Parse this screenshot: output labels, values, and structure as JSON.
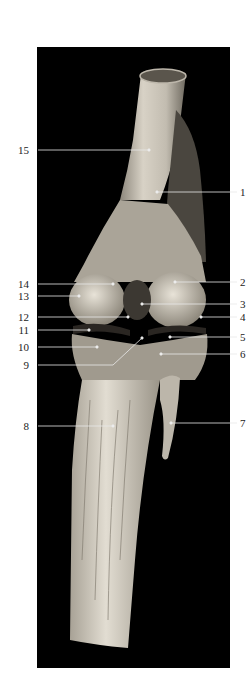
{
  "figure": {
    "panel_background": "#000000",
    "specimen_tone": "#cfc9bd",
    "leader_color": "#e8e8e8",
    "labels": [
      {
        "id": "1",
        "text": "1",
        "side": "right",
        "y": 192,
        "tx": 157,
        "ty": 192
      },
      {
        "id": "2",
        "text": "2",
        "side": "right",
        "y": 282,
        "tx": 175,
        "ty": 282
      },
      {
        "id": "3",
        "text": "3",
        "side": "right",
        "y": 304,
        "tx": 142,
        "ty": 304
      },
      {
        "id": "4",
        "text": "4",
        "side": "right",
        "y": 317,
        "tx": 201,
        "ty": 317
      },
      {
        "id": "5",
        "text": "5",
        "side": "right",
        "y": 337,
        "tx": 170,
        "ty": 337
      },
      {
        "id": "6",
        "text": "6",
        "side": "right",
        "y": 354,
        "tx": 161,
        "ty": 354
      },
      {
        "id": "7",
        "text": "7",
        "side": "right",
        "y": 423,
        "tx": 171,
        "ty": 423
      },
      {
        "id": "8",
        "text": "8",
        "side": "left",
        "y": 426,
        "tx": 113,
        "ty": 426
      },
      {
        "id": "9",
        "text": "9",
        "side": "left",
        "y": 365,
        "tx": 142,
        "ty": 338,
        "bend_x": 113
      },
      {
        "id": "10",
        "text": "10",
        "side": "left",
        "y": 347,
        "tx": 97,
        "ty": 347
      },
      {
        "id": "11",
        "text": "11",
        "side": "left",
        "y": 330,
        "tx": 89,
        "ty": 330
      },
      {
        "id": "12",
        "text": "12",
        "side": "left",
        "y": 317,
        "tx": 128,
        "ty": 317
      },
      {
        "id": "13",
        "text": "13",
        "side": "left",
        "y": 296,
        "tx": 79,
        "ty": 296
      },
      {
        "id": "14",
        "text": "14",
        "side": "left",
        "y": 284,
        "tx": 113,
        "ty": 284
      },
      {
        "id": "15",
        "text": "15",
        "side": "left",
        "y": 150,
        "tx": 149,
        "ty": 150
      }
    ]
  }
}
